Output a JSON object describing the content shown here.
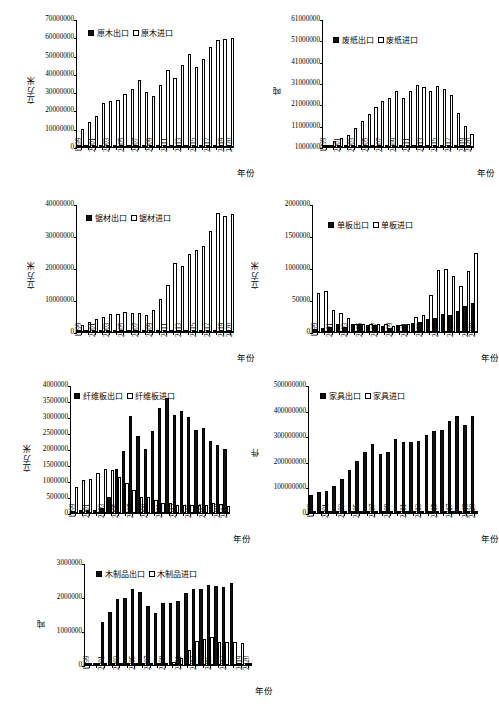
{
  "figure": {
    "years": [
      "1999",
      "2000",
      "2001",
      "2002",
      "2003",
      "2004",
      "2005",
      "2006",
      "2007",
      "2008",
      "2009",
      "2010",
      "2011",
      "2012",
      "2013",
      "2014",
      "2015",
      "2016",
      "2017",
      "2018",
      "2019",
      "2020"
    ],
    "year_ticks": [
      "1999",
      "",
      "2001",
      "",
      "2003",
      "",
      "2005",
      "",
      "2007",
      "",
      "2009",
      "",
      "2011",
      "",
      "2013",
      "",
      "2015",
      "",
      "2017",
      "",
      "2019",
      "2020"
    ],
    "xaxis_title": "年份"
  },
  "chart_data": [
    {
      "id": "logs",
      "type": "bar",
      "title": "",
      "xlabel": "年份",
      "ylabel": "立方米",
      "ylim": [
        0,
        70000000
      ],
      "ytick_values": [
        0,
        10000000,
        20000000,
        30000000,
        40000000,
        50000000,
        60000000,
        70000000
      ],
      "ytick_labels": [
        "0",
        "10000000",
        "20000000",
        "30000000",
        "40000000",
        "50000000",
        "60000000",
        "70000000"
      ],
      "grid": false,
      "legend_position": "top-left",
      "categories": [
        "1999",
        "2000",
        "2001",
        "2002",
        "2003",
        "2004",
        "2005",
        "2006",
        "2007",
        "2008",
        "2009",
        "2010",
        "2011",
        "2012",
        "2013",
        "2014",
        "2015",
        "2016",
        "2017",
        "2018",
        "2019",
        "2020"
      ],
      "series": [
        {
          "name": "原木出口",
          "style": "filled",
          "values": [
            200000,
            150000,
            150000,
            150000,
            150000,
            150000,
            150000,
            150000,
            150000,
            150000,
            150000,
            150000,
            150000,
            150000,
            150000,
            150000,
            150000,
            150000,
            150000,
            150000,
            150000,
            150000
          ]
        },
        {
          "name": "原木进口",
          "style": "hollow",
          "values": [
            10100000,
            13600000,
            16900000,
            24400000,
            25200000,
            25900000,
            29300000,
            32100000,
            37100000,
            30200000,
            28000000,
            34400000,
            42200000,
            38200000,
            45000000,
            51100000,
            44000000,
            48700000,
            55300000,
            59200000,
            59600000,
            59900000
          ]
        }
      ]
    },
    {
      "id": "waste-paper",
      "type": "bar",
      "title": "",
      "xlabel": "年份",
      "ylabel": "吨",
      "ylim": [
        1000000,
        61000000
      ],
      "ytick_values": [
        1000000,
        11000000,
        21000000,
        31000000,
        41000000,
        51000000,
        61000000
      ],
      "ytick_labels": [
        "1000000",
        "11000000",
        "21000000",
        "31000000",
        "41000000",
        "51000000",
        "61000000"
      ],
      "grid": false,
      "legend_position": "top-left",
      "categories": [
        "1999",
        "2000",
        "2001",
        "2002",
        "2003",
        "2004",
        "2005",
        "2006",
        "2007",
        "2008",
        "2009",
        "2010",
        "2011",
        "2012",
        "2013",
        "2014",
        "2015",
        "2016",
        "2017",
        "2018",
        "2019",
        "2020"
      ],
      "series": [
        {
          "name": "废纸出口",
          "style": "filled",
          "values": [
            1050000,
            1100000,
            1100000,
            1100000,
            1100000,
            1100000,
            1100000,
            1100000,
            1100000,
            1100000,
            1100000,
            1100000,
            1100000,
            1100000,
            1100000,
            1100000,
            1100000,
            1100000,
            1100000,
            1100000,
            1100000,
            1100000
          ]
        },
        {
          "name": "废纸进口",
          "style": "hollow",
          "values": [
            2000000,
            3700000,
            5400000,
            6900000,
            9900000,
            13100000,
            16600000,
            19700000,
            22700000,
            24300000,
            27500000,
            24300000,
            27500000,
            30200000,
            29500000,
            27500000,
            29700000,
            28500000,
            25400000,
            17200000,
            11100000,
            7000000
          ]
        }
      ]
    },
    {
      "id": "sawnwood",
      "type": "bar",
      "title": "",
      "xlabel": "年份",
      "ylabel": "立方米",
      "ylim": [
        0,
        40000000
      ],
      "ytick_values": [
        0,
        10000000,
        20000000,
        30000000,
        40000000
      ],
      "ytick_labels": [
        "0",
        "10000000",
        "20000000",
        "30000000",
        "40000000"
      ],
      "grid": false,
      "legend_position": "top-left",
      "categories": [
        "1999",
        "2000",
        "2001",
        "2002",
        "2003",
        "2004",
        "2005",
        "2006",
        "2007",
        "2008",
        "2009",
        "2010",
        "2011",
        "2012",
        "2013",
        "2014",
        "2015",
        "2016",
        "2017",
        "2018",
        "2019",
        "2020"
      ],
      "series": [
        {
          "name": "锯材出口",
          "style": "filled",
          "values": [
            300000,
            350000,
            350000,
            350000,
            400000,
            400000,
            450000,
            450000,
            450000,
            450000,
            450000,
            500000,
            500000,
            500000,
            500000,
            500000,
            500000,
            500000,
            500000,
            500000,
            500000,
            500000
          ]
        },
        {
          "name": "锯材进口",
          "style": "hollow",
          "values": [
            2200000,
            3300000,
            4000000,
            4800000,
            5700000,
            5800000,
            6300000,
            6100000,
            5900000,
            5300000,
            7000000,
            10400000,
            14900000,
            21800000,
            20800000,
            24500000,
            25800000,
            27000000,
            31800000,
            37400000,
            36600000,
            37200000,
            33800000
          ]
        }
      ]
    },
    {
      "id": "veneer",
      "type": "bar",
      "title": "",
      "xlabel": "年份",
      "ylabel": "立方米",
      "ylim": [
        0,
        2000000
      ],
      "ytick_values": [
        0,
        500000,
        1000000,
        1500000,
        2000000
      ],
      "ytick_labels": [
        "0",
        "50000",
        "1000000",
        "1500000",
        "2000000"
      ],
      "grid": false,
      "legend_position": "top-left",
      "categories": [
        "1999",
        "2000",
        "2001",
        "2002",
        "2003",
        "2004",
        "2005",
        "2006",
        "2007",
        "2008",
        "2009",
        "2010",
        "2011",
        "2012",
        "2013",
        "2014",
        "2015",
        "2016",
        "2017",
        "2018",
        "2019",
        "2020"
      ],
      "series": [
        {
          "name": "单板出口",
          "style": "filled",
          "values": [
            40000,
            60000,
            75000,
            130000,
            85000,
            120000,
            125000,
            115000,
            110000,
            95000,
            70000,
            115000,
            110000,
            145000,
            160000,
            200000,
            215000,
            280000,
            265000,
            330000,
            415000,
            450000,
            440000
          ]
        },
        {
          "name": "单板进口",
          "style": "hollow",
          "values": [
            620000,
            640000,
            345000,
            295000,
            215000,
            130000,
            125000,
            130000,
            125000,
            120000,
            95000,
            110000,
            130000,
            230000,
            270000,
            590000,
            975000,
            985000,
            880000,
            720000,
            955000,
            1250000,
            1570000
          ]
        }
      ]
    },
    {
      "id": "fiberboard",
      "type": "bar",
      "title": "",
      "xlabel": "年份",
      "ylabel": "立方米",
      "ylim": [
        0,
        4000000
      ],
      "ytick_values": [
        0,
        500000,
        1000000,
        1500000,
        2000000,
        2500000,
        3000000,
        3500000,
        4000000
      ],
      "ytick_labels": [
        "0",
        "500000",
        "1000000",
        "1500000",
        "2000000",
        "2500000",
        "3000000",
        "3500000",
        "4000000"
      ],
      "grid": false,
      "legend_position": "top-left",
      "categories": [
        "1999",
        "2000",
        "2001",
        "2002",
        "2003",
        "2004",
        "2005",
        "2006",
        "2007",
        "2008",
        "2009",
        "2010",
        "2011",
        "2012",
        "2013",
        "2014",
        "2015",
        "2016",
        "2017",
        "2018",
        "2019",
        "2020"
      ],
      "series": [
        {
          "name": "纤维板出口",
          "style": "filled",
          "values": [
            60000,
            90000,
            100000,
            110000,
            150000,
            520000,
            1390000,
            1960000,
            3060000,
            2410000,
            2030000,
            2570000,
            3310000,
            3610000,
            3090000,
            3220000,
            3030000,
            2610000,
            2690000,
            2270000,
            2140000,
            2030000
          ]
        },
        {
          "name": "纤维板进口",
          "style": "hollow",
          "values": [
            810000,
            1030000,
            1080000,
            1250000,
            1400000,
            1370000,
            1120000,
            930000,
            720000,
            520000,
            510000,
            410000,
            320000,
            310000,
            250000,
            250000,
            250000,
            260000,
            260000,
            300000,
            280000,
            230000
          ]
        }
      ]
    },
    {
      "id": "furniture",
      "type": "bar",
      "title": "",
      "xlabel": "年份",
      "ylabel": "件",
      "ylim": [
        0,
        500000000
      ],
      "ytick_values": [
        0,
        100000000,
        200000000,
        300000000,
        400000000,
        500000000
      ],
      "ytick_labels": [
        "0",
        "100000000",
        "200000000",
        "300000000",
        "400000000",
        "500000000"
      ],
      "grid": false,
      "legend_position": "top-left",
      "categories": [
        "1999",
        "2000",
        "2001",
        "2002",
        "2003",
        "2004",
        "2005",
        "2006",
        "2007",
        "2008",
        "2009",
        "2010",
        "2011",
        "2012",
        "2013",
        "2014",
        "2015",
        "2016",
        "2017",
        "2018",
        "2019",
        "2020"
      ],
      "series": [
        {
          "name": "家具出口",
          "style": "filled",
          "values": [
            72000000,
            84000000,
            86000000,
            108000000,
            133000000,
            168000000,
            205000000,
            240000000,
            272000000,
            234000000,
            240000000,
            293000000,
            281000000,
            281000000,
            282000000,
            307000000,
            321000000,
            327000000,
            362000000,
            380000000,
            347000000,
            380000000
          ]
        },
        {
          "name": "家具进口",
          "style": "hollow",
          "values": [
            1000000,
            1200000,
            1400000,
            1800000,
            2400000,
            2900000,
            3300000,
            3600000,
            4000000,
            3300000,
            3600000,
            5000000,
            5200000,
            5600000,
            6200000,
            7000000,
            7400000,
            7800000,
            9000000,
            9400000,
            8600000,
            8000000
          ]
        }
      ]
    },
    {
      "id": "wood-products",
      "type": "bar",
      "title": "",
      "xlabel": "年份",
      "ylabel": "吨",
      "ylim": [
        0,
        3000000
      ],
      "ytick_values": [
        0,
        1000000,
        2000000,
        3000000
      ],
      "ytick_labels": [
        "0",
        "1000000",
        "2000000",
        "3000000"
      ],
      "grid": false,
      "legend_position": "top-left",
      "categories": [
        "1999",
        "2000",
        "2001",
        "2002",
        "2003",
        "2004",
        "2005",
        "2006",
        "2007",
        "2008",
        "2009",
        "2010",
        "2011",
        "2012",
        "2013",
        "2014",
        "2015",
        "2016",
        "2017",
        "2018",
        "2019",
        "2020"
      ],
      "series": [
        {
          "name": "木制品出口",
          "style": "filled",
          "values": [
            0,
            0,
            1290000,
            1560000,
            1960000,
            1990000,
            2270000,
            2180000,
            1740000,
            1550000,
            1850000,
            1850000,
            1900000,
            2150000,
            2250000,
            2270000,
            2390000,
            2350000,
            2330000,
            2450000,
            0,
            0
          ]
        },
        {
          "name": "木制品进口",
          "style": "hollow",
          "values": [
            0,
            0,
            40000,
            40000,
            50000,
            50000,
            60000,
            60000,
            70000,
            60000,
            70000,
            80000,
            200000,
            460000,
            700000,
            770000,
            820000,
            680000,
            680000,
            670000,
            640000,
            0
          ]
        }
      ]
    }
  ]
}
